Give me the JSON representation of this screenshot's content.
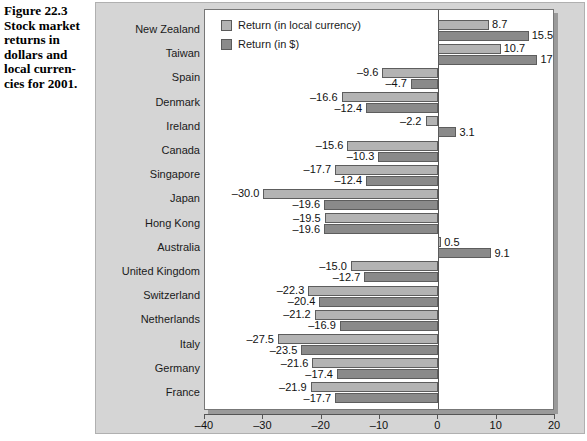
{
  "caption": {
    "lines": [
      "Figure 22.3",
      "Stock market",
      "returns in",
      "dollars and",
      "local curren-",
      "cies for 2001."
    ]
  },
  "legend": {
    "position": "top-left-inside",
    "items": [
      {
        "label": "Return (in local currency)",
        "color": "#b3b3b3",
        "key": "local"
      },
      {
        "label": "Return (in $)",
        "color": "#8a8a8a",
        "key": "usd"
      }
    ]
  },
  "colors": {
    "panel_background": "#d5d5d5",
    "plot_background": "#ffffff",
    "bar_local": "#b3b3b3",
    "bar_usd": "#8a8a8a",
    "bar_border": "#5d5d5d",
    "axis": "#555555",
    "text": "#111111"
  },
  "chart_data": {
    "type": "bar",
    "orientation": "horizontal",
    "title": "",
    "xlabel": "",
    "ylabel": "",
    "xlim": [
      -40,
      20
    ],
    "xticks": [
      -40,
      -30,
      -20,
      -10,
      0,
      10,
      20
    ],
    "xtick_labels": [
      "–40",
      "–30",
      "–20",
      "–10",
      "0",
      "10",
      "20"
    ],
    "grid": false,
    "legend_position": "upper left",
    "categories": [
      "New Zealand",
      "Taiwan",
      "Spain",
      "Denmark",
      "Ireland",
      "Canada",
      "Singapore",
      "Japan",
      "Hong Kong",
      "Australia",
      "United Kingdom",
      "Switzerland",
      "Netherlands",
      "Italy",
      "Germany",
      "France"
    ],
    "series": [
      {
        "name": "Return (in local currency)",
        "values": [
          8.7,
          10.7,
          -9.6,
          -16.6,
          -2.2,
          -15.6,
          -17.7,
          -30.0,
          -19.5,
          0.5,
          -15.0,
          -22.3,
          -21.2,
          -27.5,
          -21.6,
          -21.9
        ],
        "labels": [
          "8.7",
          "10.7",
          "–9.6",
          "–16.6",
          "–2.2",
          "–15.6",
          "–17.7",
          "–30.0",
          "–19.5",
          "0.5",
          "–15.0",
          "–22.3",
          "–21.2",
          "–27.5",
          "–21.6",
          "–21.9"
        ]
      },
      {
        "name": "Return (in $)",
        "values": [
          15.5,
          17.0,
          -4.7,
          -12.4,
          3.1,
          -10.3,
          -12.4,
          -19.6,
          -19.6,
          9.1,
          -12.7,
          -20.4,
          -16.9,
          -23.5,
          -17.4,
          -17.7
        ],
        "labels": [
          "15.5",
          "17",
          "–4.7",
          "–12.4",
          "3.1",
          "–10.3",
          "–12.4",
          "–19.6",
          "–19.6",
          "9.1",
          "–12.7",
          "–20.4",
          "–16.9",
          "–23.5",
          "–17.4",
          "–17.7"
        ]
      }
    ]
  }
}
